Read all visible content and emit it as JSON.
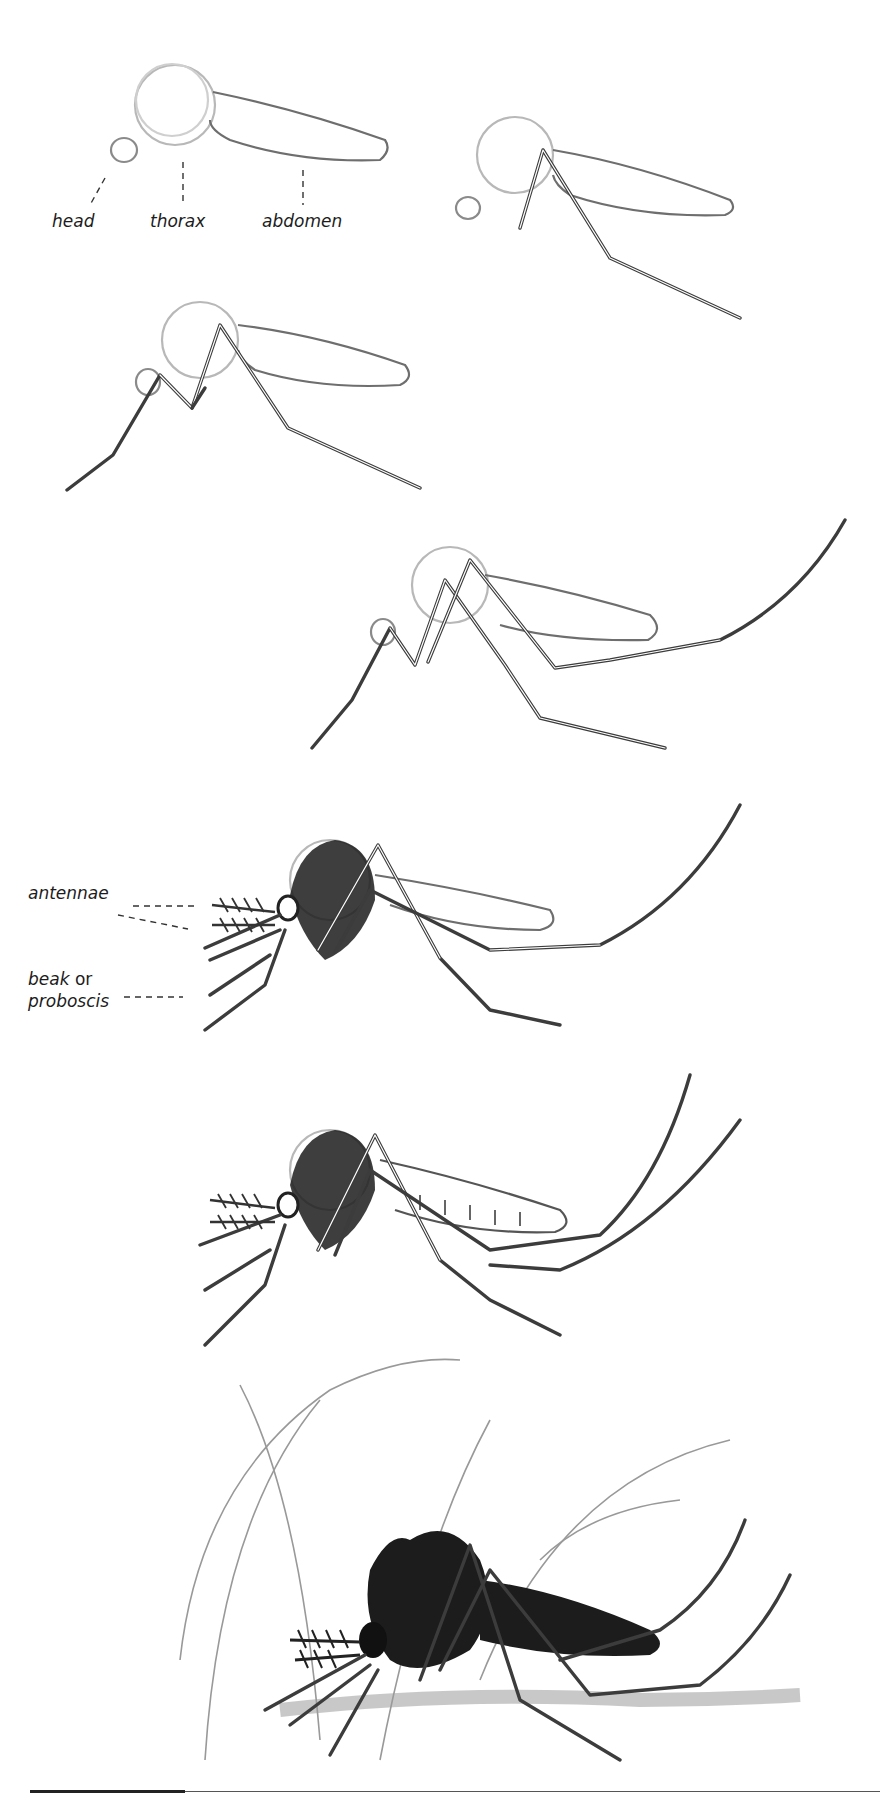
{
  "illustration": {
    "title": "How to draw a mosquito",
    "steps": [
      {
        "step": 1,
        "description": "Basic body shapes: head, thorax, abdomen"
      },
      {
        "step": 2,
        "description": "First leg added"
      },
      {
        "step": 3,
        "description": "Front and middle legs added"
      },
      {
        "step": 4,
        "description": "Long hind leg added"
      },
      {
        "step": 5,
        "description": "Hairy thorax, antennae and proboscis added"
      },
      {
        "step": 6,
        "description": "Wings and second hind leg added"
      },
      {
        "step": 7,
        "description": "Finished shaded mosquito on skin with hairs"
      }
    ]
  },
  "labels": {
    "head": "head",
    "thorax": "thorax",
    "abdomen": "abdomen",
    "antennae": "antennae",
    "beak": "beak",
    "or": " or",
    "proboscis": "proboscis"
  },
  "colors": {
    "background": "#ffffff",
    "pencil_light": "#b8b8b8",
    "pencil_dark": "#3c3c3c",
    "ink": "#1c1c1c"
  }
}
